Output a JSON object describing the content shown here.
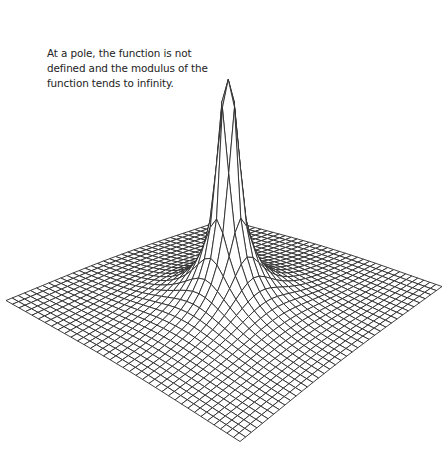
{
  "caption": {
    "lines": [
      "At a pole, the function is not",
      "defined and the modulus of the",
      "function tends to infinity."
    ]
  },
  "surface": {
    "function": "|1/z|",
    "grid_cells": 36,
    "line_color": "#2b2b2b",
    "fill_color": "#ffffff",
    "corners_px": {
      "left": [
        6,
        303
      ],
      "bottom": [
        240,
        444
      ],
      "right": [
        442,
        289
      ],
      "back": [
        225,
        222
      ]
    },
    "pole_top_px": [
      228,
      0
    ]
  }
}
